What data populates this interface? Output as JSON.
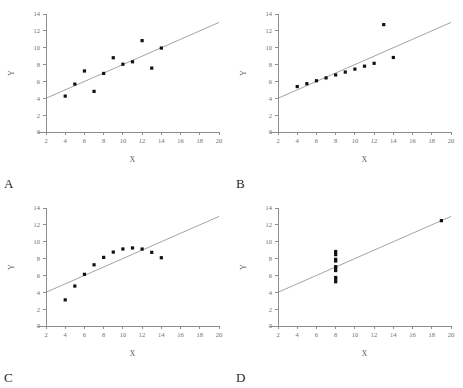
{
  "figure": {
    "background_color": "#ffffff",
    "axis_color": "#8d8d8d",
    "line_color": "#9a9a9a",
    "marker_color": "#111111",
    "panels": [
      {
        "letter": "A",
        "chart_data": {
          "type": "scatter",
          "title": "",
          "xlabel": "X",
          "ylabel": "Y",
          "xlim": [
            2,
            20
          ],
          "ylim": [
            0,
            14
          ],
          "xticks": [
            2,
            4,
            6,
            8,
            10,
            12,
            14,
            16,
            18,
            20
          ],
          "yticks": [
            0,
            2,
            4,
            6,
            8,
            10,
            12,
            14
          ],
          "grid": false,
          "legend": "none",
          "x": [
            10,
            8,
            13,
            9,
            11,
            14,
            6,
            4,
            12,
            7,
            5
          ],
          "y": [
            8.04,
            6.95,
            7.58,
            8.81,
            8.33,
            9.96,
            7.24,
            4.26,
            10.84,
            4.82,
            5.68
          ],
          "fit_line": {
            "slope": 0.5,
            "intercept": 3.0,
            "x_start": 2,
            "x_end": 20
          }
        }
      },
      {
        "letter": "B",
        "chart_data": {
          "type": "scatter",
          "title": "",
          "xlabel": "X",
          "ylabel": "Y",
          "xlim": [
            2,
            20
          ],
          "ylim": [
            0,
            14
          ],
          "xticks": [
            2,
            4,
            6,
            8,
            10,
            12,
            14,
            16,
            18,
            20
          ],
          "yticks": [
            0,
            2,
            4,
            6,
            8,
            10,
            12,
            14
          ],
          "grid": false,
          "legend": "none",
          "x": [
            10,
            8,
            13,
            9,
            11,
            14,
            6,
            4,
            12,
            7,
            5
          ],
          "y": [
            7.46,
            6.77,
            12.74,
            7.11,
            7.81,
            8.84,
            6.08,
            5.39,
            8.15,
            6.42,
            5.73
          ],
          "fit_line": {
            "slope": 0.5,
            "intercept": 3.0,
            "x_start": 2,
            "x_end": 20
          }
        }
      },
      {
        "letter": "C",
        "chart_data": {
          "type": "scatter",
          "title": "",
          "xlabel": "X",
          "ylabel": "Y",
          "xlim": [
            2,
            20
          ],
          "ylim": [
            0,
            14
          ],
          "xticks": [
            2,
            4,
            6,
            8,
            10,
            12,
            14,
            16,
            18,
            20
          ],
          "yticks": [
            0,
            2,
            4,
            6,
            8,
            10,
            12,
            14
          ],
          "grid": false,
          "legend": "none",
          "x": [
            10,
            8,
            13,
            9,
            11,
            14,
            6,
            4,
            12,
            7,
            5
          ],
          "y": [
            9.14,
            8.14,
            8.74,
            8.77,
            9.26,
            8.1,
            6.13,
            3.1,
            9.13,
            7.26,
            4.74
          ],
          "fit_line": {
            "slope": 0.5,
            "intercept": 3.0,
            "x_start": 2,
            "x_end": 20
          }
        }
      },
      {
        "letter": "D",
        "chart_data": {
          "type": "scatter",
          "title": "",
          "xlabel": "X",
          "ylabel": "Y",
          "xlim": [
            2,
            20
          ],
          "ylim": [
            0,
            14
          ],
          "xticks": [
            2,
            4,
            6,
            8,
            10,
            12,
            14,
            16,
            18,
            20
          ],
          "yticks": [
            0,
            2,
            4,
            6,
            8,
            10,
            12,
            14
          ],
          "grid": false,
          "legend": "none",
          "x": [
            8,
            8,
            8,
            8,
            8,
            8,
            8,
            19,
            8,
            8,
            8
          ],
          "y": [
            6.58,
            5.76,
            7.71,
            8.84,
            8.47,
            7.04,
            5.25,
            12.5,
            5.56,
            7.91,
            6.89
          ],
          "fit_line": {
            "slope": 0.5,
            "intercept": 3.0,
            "x_start": 2,
            "x_end": 20
          }
        }
      }
    ]
  }
}
